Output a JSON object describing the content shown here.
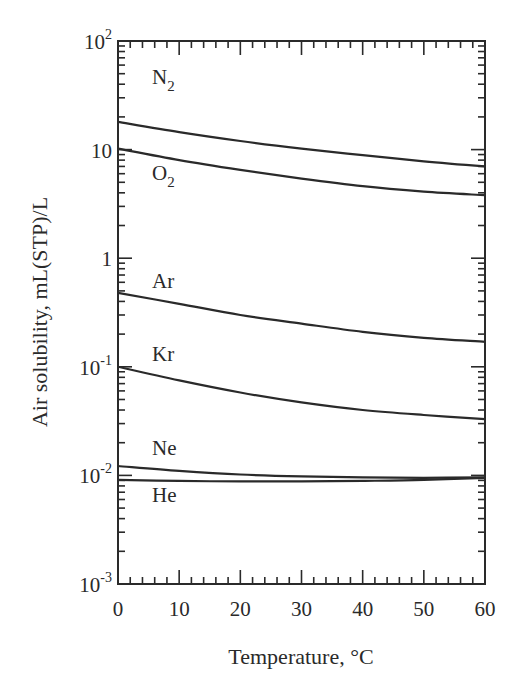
{
  "chart_data": {
    "type": "line",
    "title": "",
    "xlabel": "Temperature, °C",
    "ylabel": "Air solubility, mL(STP)/L",
    "xlim": [
      0,
      60
    ],
    "ylim": [
      0.001,
      100
    ],
    "yscale": "log",
    "grid": false,
    "legend": "inline labels",
    "x_ticks": [
      0,
      10,
      20,
      30,
      40,
      50,
      60
    ],
    "x_tick_labels": [
      "0",
      "10",
      "20",
      "30",
      "40",
      "50",
      "60"
    ],
    "y_ticks": [
      0.001,
      0.01,
      0.1,
      1,
      10,
      100
    ],
    "y_tick_labels": [
      {
        "base": "10",
        "exp": "-3"
      },
      {
        "base": "10",
        "exp": "-2"
      },
      {
        "base": "10",
        "exp": "-1"
      },
      {
        "base": "1",
        "exp": ""
      },
      {
        "base": "10",
        "exp": ""
      },
      {
        "base": "10",
        "exp": "2"
      }
    ],
    "x": [
      0,
      10,
      20,
      30,
      40,
      50,
      60
    ],
    "series": [
      {
        "name": "N2",
        "label_main": "N",
        "label_sub": "2",
        "label_pos": [
          152,
          84
        ],
        "values": [
          18.0,
          14.5,
          12.0,
          10.2,
          8.9,
          7.8,
          7.0
        ]
      },
      {
        "name": "O2",
        "label_main": "O",
        "label_sub": "2",
        "label_pos": [
          152,
          180
        ],
        "values": [
          10.2,
          8.0,
          6.5,
          5.4,
          4.6,
          4.1,
          3.8
        ]
      },
      {
        "name": "Ar",
        "label_main": "Ar",
        "label_sub": "",
        "label_pos": [
          152,
          288
        ],
        "values": [
          0.48,
          0.38,
          0.3,
          0.25,
          0.21,
          0.185,
          0.17
        ]
      },
      {
        "name": "Kr",
        "label_main": "Kr",
        "label_sub": "",
        "label_pos": [
          152,
          361
        ],
        "values": [
          0.1,
          0.075,
          0.058,
          0.047,
          0.04,
          0.036,
          0.033
        ]
      },
      {
        "name": "Ne",
        "label_main": "Ne",
        "label_sub": "",
        "label_pos": [
          152,
          455
        ],
        "values": [
          0.0122,
          0.011,
          0.0102,
          0.0098,
          0.0096,
          0.0095,
          0.0096
        ]
      },
      {
        "name": "He",
        "label_main": "He",
        "label_sub": "",
        "label_pos": [
          152,
          502
        ],
        "values": [
          0.0091,
          0.0089,
          0.0088,
          0.0088,
          0.0089,
          0.0091,
          0.0095
        ]
      }
    ]
  },
  "layout": {
    "plot_left": 118,
    "plot_right": 485,
    "plot_top": 41,
    "plot_bottom": 584,
    "line_color": "#2a2a2a"
  }
}
